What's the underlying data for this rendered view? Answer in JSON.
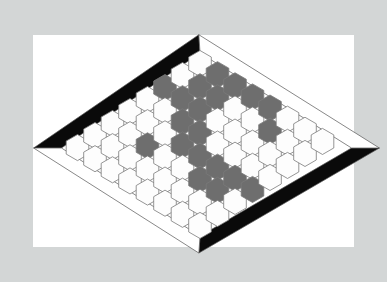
{
  "scene": {
    "title": "Hex game board",
    "description": "Rhombus-shaped hexagonal Hex board photographed on a white mat with a light gray surround",
    "frame_color": "#d3d6d6",
    "mat_color": "#ffffff"
  },
  "board": {
    "shape": "rhombus",
    "size": 8,
    "cell_outline_color": "#7a7a7a",
    "edge_black_color": "#0a0a0a",
    "edge_white_color": "#ffffff",
    "edge_outline_color": "#555555",
    "corners": {
      "top": [
        200,
        52
      ],
      "right": [
        353,
        148
      ],
      "bottom": [
        200,
        237
      ],
      "left": [
        60,
        148
      ]
    },
    "player_colors": {
      "empty": "#fdfdfd",
      "white": "#fdfdfd",
      "gray": "#6e6e6e"
    },
    "edges": [
      {
        "name": "top-left-edge",
        "owner": "black",
        "color": "#0a0a0a"
      },
      {
        "name": "bottom-right-edge",
        "owner": "black",
        "color": "#0a0a0a"
      },
      {
        "name": "top-right-edge",
        "owner": "white",
        "color": "#ffffff"
      },
      {
        "name": "bottom-left-edge",
        "owner": "white",
        "color": "#ffffff"
      }
    ],
    "legend": [
      {
        "key": "gray",
        "label": "Gray stone",
        "color": "#6e6e6e"
      },
      {
        "key": "white",
        "label": "White / empty cell",
        "color": "#fdfdfd"
      }
    ],
    "cells": [
      [
        "e",
        "e",
        "e",
        "e",
        "w",
        "g",
        "e",
        "e"
      ],
      [
        "e",
        "e",
        "e",
        "w",
        "w",
        "g",
        "g",
        "g"
      ],
      [
        "e",
        "e",
        "g",
        "w",
        "g",
        "g",
        "g",
        "g"
      ],
      [
        "e",
        "w",
        "w",
        "g",
        "g",
        "w",
        "w",
        "g"
      ],
      [
        "w",
        "w",
        "w",
        "g",
        "w",
        "w",
        "w",
        "g"
      ],
      [
        "w",
        "w",
        "g",
        "g",
        "w",
        "w",
        "g",
        "e"
      ],
      [
        "w",
        "w",
        "g",
        "g",
        "w",
        "w",
        "e",
        "e"
      ],
      [
        "e",
        "w",
        "w",
        "g",
        "e",
        "e",
        "e",
        "e"
      ]
    ]
  }
}
